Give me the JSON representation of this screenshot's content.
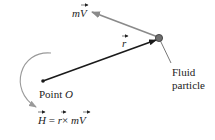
{
  "diagram": {
    "colors": {
      "r_vector": "#1a1a1a",
      "mv_vector": "#8a8a8a",
      "rotation_arrow": "#9a9a9a",
      "particle": "#555555",
      "text": "#222222"
    },
    "labels": {
      "momentum": {
        "m": "m",
        "V": "V"
      },
      "position": {
        "r": "r"
      },
      "particle": {
        "line1": "Fluid",
        "line2": "particle"
      },
      "origin": {
        "prefix": "Point ",
        "name": "O"
      },
      "formula": {
        "H": "H",
        "equals": " = ",
        "r": "r",
        "times": "×",
        "m": " m",
        "V": "V"
      }
    }
  }
}
